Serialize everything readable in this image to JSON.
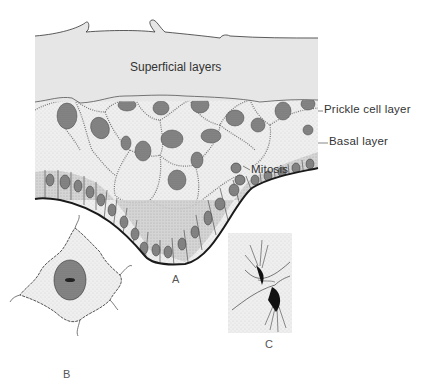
{
  "figure": {
    "panel_a": {
      "label": "A",
      "regions": {
        "superficial": "Superficial layers",
        "prickle": "Prickle cell layer",
        "basal": "Basal layer",
        "mitosis": "Mitosis"
      }
    },
    "panel_b": {
      "label": "B"
    },
    "panel_c": {
      "label": "C"
    }
  },
  "colors": {
    "superficial_fill": "#e6e6e6",
    "prickle_fill": "#f1f1f1",
    "basal_fill": "#d4d4d4",
    "nucleus": "#8a8a8a",
    "outline": "#222222"
  }
}
